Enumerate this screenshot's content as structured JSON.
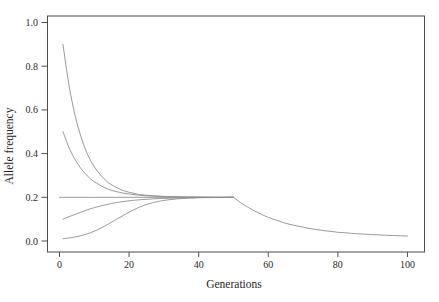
{
  "figure": {
    "background_color": "#ffffff",
    "frame_color": "#4d4d4d",
    "curve_color": "#8f8f8f",
    "text_color": "#1f1f1f"
  },
  "chart_data": {
    "type": "line",
    "title": "",
    "xlabel": "Generations",
    "ylabel": "Allele frequency",
    "xlim": [
      -3.45,
      104.9
    ],
    "ylim": [
      -0.0503,
      1.0297
    ],
    "x_ticks": [
      0,
      20,
      40,
      60,
      80,
      100
    ],
    "y_ticks": [
      "0.0",
      "0.2",
      "0.4",
      "0.6",
      "0.8",
      "1.0"
    ],
    "grid": false,
    "legend": "none",
    "frame": "full-box",
    "equilibrium_frequency_before_gen_50": 0.2,
    "equilibrium_frequency_after_gen_50": 0.02,
    "series": [
      {
        "name": "start-frequency-0.9",
        "points": [
          [
            1,
            0.9
          ],
          [
            2,
            0.785
          ],
          [
            3,
            0.688
          ],
          [
            4,
            0.608
          ],
          [
            5,
            0.541
          ],
          [
            6,
            0.485
          ],
          [
            7,
            0.438
          ],
          [
            8,
            0.399
          ],
          [
            9,
            0.366
          ],
          [
            10,
            0.339
          ],
          [
            12,
            0.297
          ],
          [
            14,
            0.267
          ],
          [
            16,
            0.247
          ],
          [
            18,
            0.233
          ],
          [
            20,
            0.223
          ],
          [
            23,
            0.213
          ],
          [
            26,
            0.208
          ],
          [
            30,
            0.204
          ],
          [
            35,
            0.202
          ],
          [
            40,
            0.201
          ],
          [
            45,
            0.2
          ],
          [
            50,
            0.2
          ]
        ]
      },
      {
        "name": "start-frequency-0.5",
        "points": [
          [
            1,
            0.5
          ],
          [
            2,
            0.456
          ],
          [
            3,
            0.418
          ],
          [
            4,
            0.386
          ],
          [
            5,
            0.358
          ],
          [
            6,
            0.335
          ],
          [
            7,
            0.315
          ],
          [
            8,
            0.298
          ],
          [
            9,
            0.283
          ],
          [
            10,
            0.271
          ],
          [
            12,
            0.252
          ],
          [
            14,
            0.237
          ],
          [
            16,
            0.227
          ],
          [
            18,
            0.22
          ],
          [
            20,
            0.215
          ],
          [
            23,
            0.209
          ],
          [
            26,
            0.206
          ],
          [
            30,
            0.203
          ],
          [
            35,
            0.201
          ],
          [
            40,
            0.201
          ],
          [
            45,
            0.2
          ],
          [
            50,
            0.2
          ]
        ]
      },
      {
        "name": "equilibrium-0.2-then-decline-after-gen-50",
        "points": [
          [
            0,
            0.2
          ],
          [
            10,
            0.2
          ],
          [
            20,
            0.2
          ],
          [
            30,
            0.2
          ],
          [
            40,
            0.2
          ],
          [
            50,
            0.2
          ],
          [
            52,
            0.176
          ],
          [
            54,
            0.156
          ],
          [
            56,
            0.138
          ],
          [
            58,
            0.122
          ],
          [
            60,
            0.108
          ],
          [
            62,
            0.097
          ],
          [
            64,
            0.086
          ],
          [
            66,
            0.077
          ],
          [
            68,
            0.07
          ],
          [
            70,
            0.063
          ],
          [
            72,
            0.057
          ],
          [
            74,
            0.052
          ],
          [
            76,
            0.047
          ],
          [
            78,
            0.044
          ],
          [
            80,
            0.04
          ],
          [
            82,
            0.038
          ],
          [
            84,
            0.035
          ],
          [
            86,
            0.033
          ],
          [
            88,
            0.031
          ],
          [
            90,
            0.029
          ],
          [
            92,
            0.028
          ],
          [
            94,
            0.026
          ],
          [
            96,
            0.025
          ],
          [
            98,
            0.024
          ],
          [
            100,
            0.023
          ]
        ]
      },
      {
        "name": "start-frequency-0.1",
        "points": [
          [
            1,
            0.1
          ],
          [
            3,
            0.113
          ],
          [
            5,
            0.125
          ],
          [
            7,
            0.137
          ],
          [
            9,
            0.148
          ],
          [
            11,
            0.157
          ],
          [
            13,
            0.165
          ],
          [
            15,
            0.172
          ],
          [
            18,
            0.18
          ],
          [
            21,
            0.186
          ],
          [
            24,
            0.19
          ],
          [
            27,
            0.193
          ],
          [
            30,
            0.195
          ],
          [
            34,
            0.197
          ],
          [
            38,
            0.198
          ],
          [
            42,
            0.199
          ],
          [
            46,
            0.199
          ],
          [
            50,
            0.2
          ]
        ]
      },
      {
        "name": "start-frequency-0.01",
        "points": [
          [
            1,
            0.01
          ],
          [
            3,
            0.014
          ],
          [
            5,
            0.02
          ],
          [
            7,
            0.028
          ],
          [
            9,
            0.038
          ],
          [
            11,
            0.052
          ],
          [
            13,
            0.068
          ],
          [
            15,
            0.087
          ],
          [
            17,
            0.105
          ],
          [
            19,
            0.123
          ],
          [
            21,
            0.14
          ],
          [
            23,
            0.155
          ],
          [
            25,
            0.167
          ],
          [
            27,
            0.176
          ],
          [
            29,
            0.183
          ],
          [
            31,
            0.188
          ],
          [
            34,
            0.193
          ],
          [
            37,
            0.196
          ],
          [
            40,
            0.198
          ],
          [
            45,
            0.199
          ],
          [
            50,
            0.2
          ]
        ]
      }
    ]
  }
}
